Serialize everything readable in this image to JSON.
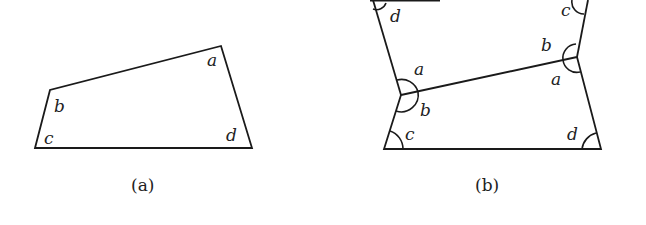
{
  "figure_a": {
    "caption": "(a)",
    "angle_labels": {
      "a": "a",
      "b": "b",
      "c": "c",
      "d": "d"
    }
  },
  "figure_b": {
    "caption": "(b)",
    "angle_labels": {
      "top_left_d": "d",
      "top_right_c": "c",
      "mid_right_b": "b",
      "mid_right_a": "a",
      "mid_left_a": "a",
      "mid_left_b": "b",
      "bottom_left_c": "c",
      "bottom_right_d": "d"
    }
  }
}
